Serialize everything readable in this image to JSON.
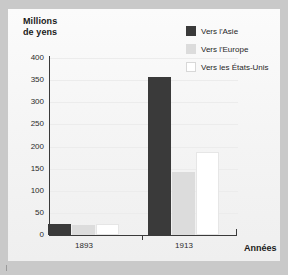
{
  "chart_data": {
    "type": "bar",
    "title": "",
    "ylabel": "Millions de yens",
    "xlabel": "Années",
    "categories": [
      "1893",
      "1913"
    ],
    "series": [
      {
        "name": "Vers l'Asie",
        "color": "#3a3a3a",
        "values": [
          25,
          357
        ]
      },
      {
        "name": "Vers l'Europe",
        "color": "#dcdcdc",
        "values": [
          23,
          143
        ]
      },
      {
        "name": "Vers les États-Unis",
        "color": "#ffffff",
        "values": [
          24,
          188
        ]
      }
    ],
    "ylim": [
      0,
      400
    ],
    "yticks": [
      400,
      350,
      300,
      250,
      200,
      150,
      100,
      50,
      0
    ],
    "ytick_labels": [
      "400",
      "350",
      "300",
      "250",
      "200",
      "150",
      "100",
      "50",
      "0"
    ],
    "grid": true,
    "legend_position": "top-right"
  },
  "axes": {
    "y_title_line1": "Millions",
    "y_title_line2": "de yens",
    "x_title": "Années"
  },
  "legend": {
    "items": [
      {
        "label": "Vers l'Asie",
        "color": "#3a3a3a"
      },
      {
        "label": "Vers l'Europe",
        "color": "#dcdcdc"
      },
      {
        "label": "Vers les États-Unis",
        "color": "#ffffff"
      }
    ]
  },
  "colors": {
    "background": "#c9c9c9",
    "panel": "#f7f7f7",
    "axis": "#3a3a3a",
    "grid": "#ececec",
    "text": "#1f1f1f"
  }
}
